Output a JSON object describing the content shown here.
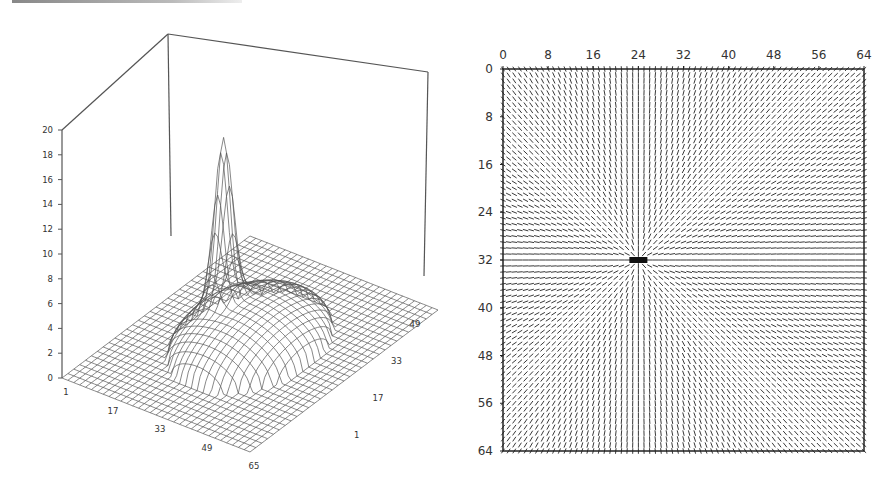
{
  "chart_data": [
    {
      "type": "surface",
      "title": "",
      "description": "3D wireframe surface of a 65x65 grid: a sharp spike near (24,33) rising to ~20, surrounded by a circular shallow dome (height ~3-5) centered near the middle of the plane; elsewhere height 0.",
      "z_axis": {
        "ticks": [
          "0",
          "2",
          "4",
          "6",
          "8",
          "10",
          "12",
          "14",
          "16",
          "18",
          "20"
        ],
        "range": [
          0,
          20
        ]
      },
      "x_axis": {
        "ticks": [
          "1",
          "17",
          "33",
          "49",
          "65"
        ],
        "range": [
          1,
          65
        ]
      },
      "y_axis": {
        "ticks": [
          "1",
          "17",
          "33",
          "49"
        ],
        "range": [
          1,
          65
        ]
      },
      "grid_size": 65,
      "peak": {
        "x": 24,
        "y": 33,
        "z": 20
      },
      "dome": {
        "center_x": 33,
        "center_y": 33,
        "radius": 20,
        "height": 4
      },
      "grid": true,
      "legend": "none"
    },
    {
      "type": "vector_field",
      "title": "",
      "description": "Quiver/streamline plot on a 64x64 grid with lines converging radially toward a singular point at (24,32).",
      "x_axis": {
        "ticks": [
          "0",
          "8",
          "16",
          "24",
          "32",
          "40",
          "48",
          "56",
          "64"
        ],
        "range": [
          0,
          64
        ],
        "position": "top"
      },
      "y_axis": {
        "ticks": [
          "0",
          "8",
          "16",
          "24",
          "32",
          "40",
          "48",
          "56",
          "64"
        ],
        "range": [
          0,
          64
        ],
        "inverted": true
      },
      "singular_point": {
        "x": 24,
        "y": 32
      },
      "grid_size": 64,
      "legend": "none"
    }
  ]
}
